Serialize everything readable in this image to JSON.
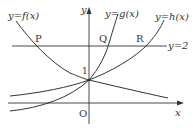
{
  "diagram": {
    "axes": {
      "x_label": "x",
      "y_label": "y",
      "origin_label": "O",
      "y_intercept_label": "1"
    },
    "curves": [
      {
        "name": "f",
        "label": "y=f(x)",
        "description": "decreasing exponential through (0,1)"
      },
      {
        "name": "g",
        "label": "y=g(x)",
        "description": "steep increasing exponential through (0,1)"
      },
      {
        "name": "h",
        "label": "y=h(x)",
        "description": "gentle increasing exponential through (0,1)"
      }
    ],
    "horizontal_line": {
      "label": "y=2",
      "value": 2
    },
    "points": [
      {
        "label": "P",
        "on": "f",
        "at": "y=2"
      },
      {
        "label": "Q",
        "on": "g",
        "at": "y=2"
      },
      {
        "label": "R",
        "on": "h",
        "at": "y=2"
      }
    ],
    "colors": {
      "stroke": "#333333",
      "background": "#ffffff"
    }
  }
}
